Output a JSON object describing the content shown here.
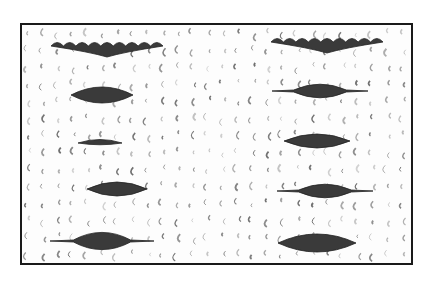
{
  "image": {
    "description": "Close-up grayscale photograph of white knit/crochet fabric with two columns of eyelet holes",
    "frame_color": "#1a1a1a",
    "background_color": "#fdfdfd",
    "hole_color": "#3a3a3a",
    "stitch_color": "#555555",
    "columns": [
      {
        "name": "left",
        "holes": [
          {
            "cx": 85,
            "cy": 21,
            "w": 112,
            "h": 10,
            "shape": "scalloped"
          },
          {
            "cx": 80,
            "cy": 70,
            "w": 62,
            "h": 16,
            "shape": "diamond"
          },
          {
            "cx": 78,
            "cy": 118,
            "w": 44,
            "h": 7,
            "shape": "slit"
          },
          {
            "cx": 95,
            "cy": 164,
            "w": 60,
            "h": 14,
            "shape": "diamond"
          },
          {
            "cx": 80,
            "cy": 216,
            "w": 104,
            "h": 18,
            "shape": "diamond-tail"
          }
        ]
      },
      {
        "name": "right",
        "holes": [
          {
            "cx": 305,
            "cy": 17,
            "w": 112,
            "h": 10,
            "shape": "scalloped"
          },
          {
            "cx": 298,
            "cy": 66,
            "w": 96,
            "h": 14,
            "shape": "diamond-tail"
          },
          {
            "cx": 295,
            "cy": 116,
            "w": 66,
            "h": 14,
            "shape": "diamond"
          },
          {
            "cx": 303,
            "cy": 166,
            "w": 96,
            "h": 14,
            "shape": "diamond-tail"
          },
          {
            "cx": 295,
            "cy": 218,
            "w": 78,
            "h": 18,
            "shape": "diamond"
          }
        ]
      }
    ]
  }
}
